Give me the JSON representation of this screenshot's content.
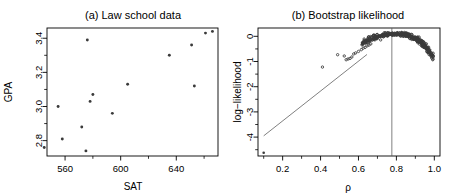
{
  "figure": {
    "background": "#ffffff",
    "foreground": "#000000",
    "point_color": "#3a3a3a",
    "line_color": "#555555"
  },
  "chart_data": [
    {
      "type": "scatter",
      "panel_id": "a",
      "title": "(a) Law school data",
      "xlabel": "SAT",
      "ylabel": "GPA",
      "xlim": [
        547,
        670
      ],
      "ylim": [
        2.71,
        3.46
      ],
      "xticks": [
        560,
        600,
        640,
        680
      ],
      "xtick_labels": [
        "560",
        "600",
        "640",
        ""
      ],
      "yticks": [
        2.8,
        3.0,
        3.2,
        3.4
      ],
      "ytick_labels": [
        "2.8",
        "3.0",
        "3.2",
        "3.4"
      ],
      "grid": false,
      "legend": "none",
      "n_points": 15,
      "x": [
        576,
        635,
        558,
        578,
        666,
        580,
        555,
        661,
        651,
        605,
        653,
        575,
        545,
        572,
        594
      ],
      "y": [
        3.39,
        3.3,
        2.81,
        3.03,
        3.44,
        3.07,
        3.0,
        3.43,
        3.36,
        3.13,
        3.12,
        2.74,
        2.76,
        2.88,
        2.96
      ]
    },
    {
      "type": "scatter",
      "panel_id": "b",
      "title": "(b) Bootstrap likelihood",
      "xlabel": "ρ",
      "ylabel": "log−likelihood",
      "xlim": [
        0.07,
        1.03
      ],
      "ylim": [
        -4.75,
        0.33
      ],
      "xticks": [
        0.2,
        0.4,
        0.6,
        0.8,
        1.0
      ],
      "xtick_labels": [
        "0.2",
        "0.4",
        "0.6",
        "0.8",
        "1.0"
      ],
      "yticks": [
        0,
        -1,
        -2,
        -3,
        -4
      ],
      "ytick_labels": [
        "0",
        "-1",
        "-2",
        "-3",
        "-4"
      ],
      "grid": false,
      "legend": "none",
      "vline_x": 0.776,
      "refline": {
        "x0": 0.1,
        "y0": -3.95,
        "x1": 0.645,
        "y1": -0.72
      },
      "outlier": {
        "x": 0.1,
        "y": -4.62
      },
      "sparse_points": [
        [
          0.41,
          -1.22
        ],
        [
          0.49,
          -0.73
        ],
        [
          0.525,
          -0.78
        ],
        [
          0.535,
          -0.93
        ],
        [
          0.545,
          -0.9
        ],
        [
          0.555,
          -0.88
        ],
        [
          0.565,
          -0.82
        ],
        [
          0.575,
          -0.7
        ],
        [
          0.585,
          -0.66
        ],
        [
          0.6,
          -0.6
        ],
        [
          0.615,
          -0.53
        ],
        [
          0.625,
          -0.47
        ],
        [
          0.635,
          -0.44
        ],
        [
          0.645,
          -0.38
        ],
        [
          0.655,
          -0.35
        ],
        [
          0.665,
          -0.3
        ]
      ],
      "cloud_peak_x": 0.8,
      "cloud_peak_y": 0.1,
      "cloud_n": 400
    }
  ],
  "panel_a": {
    "title": "(a) Law school data",
    "xlabel": "SAT",
    "ylabel": "GPA"
  },
  "panel_b": {
    "title": "(b) Bootstrap likelihood",
    "xlabel": "ρ",
    "ylabel": "log−likelihood"
  }
}
